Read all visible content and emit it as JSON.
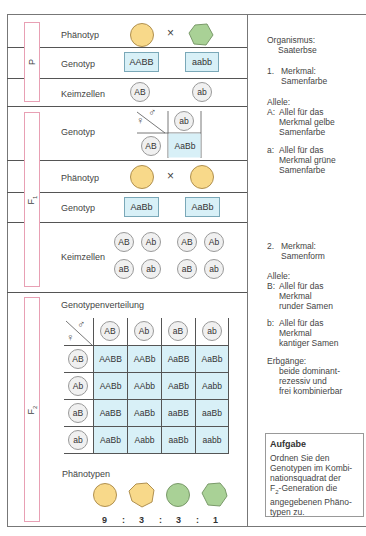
{
  "generations": {
    "p": {
      "label": "P"
    },
    "f1": {
      "label": "F",
      "sub": "1"
    },
    "f2": {
      "label": "F",
      "sub": "2"
    }
  },
  "p_section": {
    "phenotype_label": "Phänotyp",
    "genotype_label": "Genotyp",
    "gametes_label": "Keimzellen",
    "cross_symbol": "×",
    "parent1": {
      "phenotype": "yellow-round",
      "genotype": "AABB",
      "gamete": "AB"
    },
    "parent2": {
      "phenotype": "green-angular",
      "genotype": "aabb",
      "gamete": "ab"
    }
  },
  "f1_section": {
    "genotype_label": "Genotyp",
    "phenotype_label": "Phänotyp",
    "genotype_label_2": "Genotyp",
    "gametes_label": "Keimzellen",
    "cross_symbol": "×",
    "mini_punnett": {
      "female_symbol": "♀",
      "male_symbol": "♂",
      "male_gamete": "ab",
      "female_gamete": "AB",
      "result": "AaBb"
    },
    "parent1": {
      "phenotype": "yellow-round",
      "genotype": "AaBb",
      "gametes": [
        "AB",
        "Ab",
        "aB",
        "ab"
      ]
    },
    "parent2": {
      "phenotype": "yellow-round",
      "genotype": "AaBb",
      "gametes": [
        "AB",
        "Ab",
        "aB",
        "ab"
      ]
    }
  },
  "f2_section": {
    "title": "Genotypenverteilung",
    "female_symbol": "♀",
    "male_symbol": "♂",
    "col_headers": [
      "AB",
      "Ab",
      "aB",
      "ab"
    ],
    "row_headers": [
      "AB",
      "Ab",
      "aB",
      "ab"
    ],
    "grid": [
      [
        "AABB",
        "AABb",
        "AaBB",
        "AaBb"
      ],
      [
        "AABb",
        "AAbb",
        "AaBb",
        "Aabb"
      ],
      [
        "AaBB",
        "AaBb",
        "aaBB",
        "aaBb"
      ],
      [
        "AaBb",
        "Aabb",
        "aaBb",
        "aabb"
      ]
    ],
    "phenotypes_label": "Phänotypen",
    "phenotypes": [
      "yellow-round",
      "yellow-angular",
      "green-round",
      "green-angular"
    ],
    "ratio": [
      "9",
      ":",
      "3",
      ":",
      "3",
      ":",
      "1"
    ]
  },
  "info": {
    "organism_label": "Organismus:",
    "organism": "Saaterbse",
    "trait1_num": "1.",
    "trait1_label": "Merkmal:",
    "trait1_name": "Samenfarbe",
    "alleles1_label": "Allele:",
    "allele_A_key": "A:",
    "allele_A_lines": [
      "Allel für das",
      "Merkmal gelbe",
      "Samenfarbe"
    ],
    "allele_a_key": "a:",
    "allele_a_lines": [
      "Allel für das",
      "Merkmal grüne",
      "Samenfarbe"
    ],
    "trait2_num": "2.",
    "trait2_label": "Merkmal:",
    "trait2_name": "Samenform",
    "alleles2_label": "Allele:",
    "allele_B_key": "B:",
    "allele_B_lines": [
      "Allel für das",
      "Merkmal",
      "runder Samen"
    ],
    "allele_b_key": "b:",
    "allele_b_lines": [
      "Allel für das",
      "Merkmal",
      "kantiger Samen"
    ],
    "inheritance_label": "Erbgänge:",
    "inheritance_lines": [
      "beide dominant-",
      "rezessiv und",
      "frei kombinierbar"
    ]
  },
  "task": {
    "title": "Aufgabe",
    "lines": [
      "Ordnen Sie den",
      "Genotypen im Kombi-",
      "nationsquadrat der",
      "-Generation die",
      "angegebenen Phäno-",
      "typen zu."
    ],
    "f2_prefix": "F",
    "f2_sub": "2"
  },
  "colors": {
    "yellow_seed": "#f8d98a",
    "green_seed": "#a9d196",
    "genotype_box": "#d8f0f7",
    "generation_label_border": "#e8a0b4"
  }
}
